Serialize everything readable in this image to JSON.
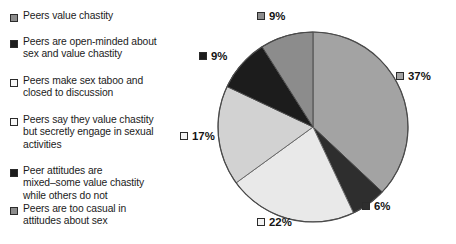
{
  "chart_data": {
    "type": "pie",
    "title": "",
    "legend_position": "left",
    "categories": [
      "Peers value chastity",
      "Peers are open-minded about sex and value chastity",
      "Peers make sex taboo and closed to discussion",
      "Peers say they value chastity but secretly engage in sexual activities",
      "Peer attitudes are mixed–some value chastity while others do not",
      "Peers are too casual in attitudes about sex"
    ],
    "values": [
      9,
      9,
      17,
      22,
      6,
      37
    ],
    "value_labels": [
      "9%",
      "9%",
      "17%",
      "22%",
      "6%",
      "37%"
    ],
    "colors": [
      "#8c8c8c",
      "#1c1c1c",
      "#d2d2d2",
      "#e9e9e9",
      "#2e2e2e",
      "#a3a3a3"
    ],
    "units": "percent"
  },
  "legend": {
    "items": [
      {
        "label": "Peers value chastity",
        "color": "#8c8c8c",
        "swatch": "filled-square-gray"
      },
      {
        "label": "Peers are open-minded about\nsex and value chastity",
        "color": "#1c1c1c",
        "swatch": "filled-square-black"
      },
      {
        "label": "Peers make sex taboo and\nclosed to discussion",
        "color": "#f4f4f4",
        "swatch": "open-square"
      },
      {
        "label": "Peers say they value chastity\nbut secretly engage in sexual\nactivities",
        "color": "#f4f4f4",
        "swatch": "open-square"
      },
      {
        "label": "Peer attitudes are\nmixed–some value chastity\nwhile others do not",
        "color": "#1c1c1c",
        "swatch": "filled-square-black"
      },
      {
        "label": "Peers are too casual in\nattitudes about sex",
        "color": "#8c8c8c",
        "swatch": "filled-square-gray"
      }
    ]
  },
  "pie": {
    "slices": [
      {
        "name": "too-casual",
        "value": 37,
        "label": "37%",
        "color": "#a3a3a3"
      },
      {
        "name": "mixed-attitudes",
        "value": 6,
        "label": "6%",
        "color": "#2e2e2e"
      },
      {
        "name": "secretly-engage",
        "value": 22,
        "label": "22%",
        "color": "#e9e9e9"
      },
      {
        "name": "sex-taboo",
        "value": 17,
        "label": "17%",
        "color": "#d2d2d2"
      },
      {
        "name": "open-minded",
        "value": 9,
        "label": "9%",
        "color": "#1c1c1c"
      },
      {
        "name": "value-chastity",
        "value": 9,
        "label": "9%",
        "color": "#8c8c8c"
      }
    ],
    "labels": {
      "pct_37": "37%",
      "pct_6": "6%",
      "pct_22": "22%",
      "pct_17": "17%",
      "pct_9_left": "9%",
      "pct_9_top": "9%"
    }
  }
}
